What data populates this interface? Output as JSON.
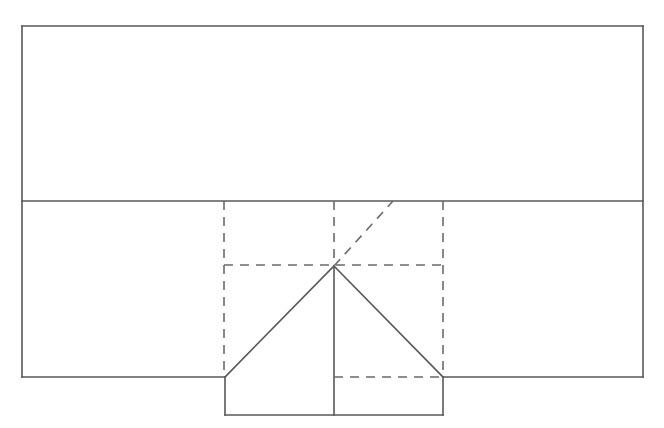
{
  "figure": {
    "canvas": {
      "width": 664,
      "height": 428,
      "background": "#ffffff"
    },
    "style": {
      "solid_stroke_color": "#58585a",
      "dashed_stroke_color": "#6b6b6d",
      "solid_stroke_width": 1.6,
      "dashed_stroke_width": 1.6,
      "dash_pattern": "9 7",
      "fill": "none"
    },
    "geometry": {
      "outer_rectangle": {
        "name": "outer-building-outline",
        "x1": 22,
        "y1": 26,
        "x2": 643,
        "y2": 377
      },
      "horizontal_divider": {
        "name": "upper-lower-division-line",
        "x1": 22,
        "y1": 201,
        "x2": 643,
        "y2": 201
      },
      "lower_bottom_left_segment": {
        "name": "bottom-edge-left-segment",
        "x1": 22,
        "y1": 377,
        "x2": 225,
        "y2": 377
      },
      "lower_bottom_right_segment": {
        "name": "bottom-edge-right-segment",
        "x1": 443,
        "y1": 377,
        "x2": 643,
        "y2": 377
      },
      "dashed_vertical_left": {
        "name": "hidden-wall-line-left",
        "x1": 224,
        "y1": 201,
        "x2": 224,
        "y2": 377
      },
      "dashed_vertical_center": {
        "name": "hidden-ridge-line-center",
        "x1": 334,
        "y1": 201,
        "x2": 334,
        "y2": 266
      },
      "dashed_vertical_right": {
        "name": "hidden-wall-line-right",
        "x1": 443,
        "y1": 201,
        "x2": 443,
        "y2": 377
      },
      "dashed_horizontal_upper": {
        "name": "hidden-eave-line-upper",
        "x1": 224,
        "y1": 265,
        "x2": 443,
        "y2": 265
      },
      "dashed_horizontal_lower": {
        "name": "hidden-eave-line-lower",
        "x1": 334,
        "y1": 377,
        "x2": 443,
        "y2": 377
      },
      "dashed_diagonal": {
        "name": "hidden-hip-rafter-line",
        "x1": 334,
        "y1": 266,
        "x2": 393,
        "y2": 201
      },
      "gable_left_slope": {
        "name": "roof-slope-left",
        "x1": 334,
        "y1": 266,
        "x2": 225,
        "y2": 377
      },
      "gable_right_slope": {
        "name": "roof-slope-right",
        "x1": 334,
        "y1": 266,
        "x2": 443,
        "y2": 377
      },
      "ridge_vertical_solid": {
        "name": "center-ridge-solid-line",
        "x1": 334,
        "y1": 266,
        "x2": 334,
        "y2": 415
      },
      "projection_box_left_wall": {
        "name": "projection-box-left-wall",
        "x1": 225,
        "y1": 377,
        "x2": 225,
        "y2": 415
      },
      "projection_box_right_wall": {
        "name": "projection-box-right-wall",
        "x1": 443,
        "y1": 377,
        "x2": 443,
        "y2": 415
      },
      "projection_box_bottom": {
        "name": "projection-box-bottom-edge",
        "x1": 225,
        "y1": 415,
        "x2": 443,
        "y2": 415
      }
    }
  }
}
